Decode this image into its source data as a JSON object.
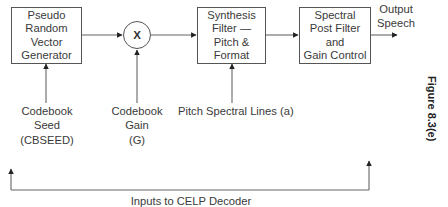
{
  "diagram": {
    "figure_label": "Figure 8.3(e)",
    "blocks": [
      {
        "id": "prvg",
        "lines": [
          "Pseudo",
          "Random",
          "Vector",
          "Generator"
        ]
      },
      {
        "id": "multiplier",
        "symbol": "X"
      },
      {
        "id": "synthesis",
        "lines": [
          "Synthesis",
          "Filter —",
          "Pitch &",
          "Format"
        ]
      },
      {
        "id": "postfilter",
        "lines": [
          "Spectral",
          "Post Filter",
          "and",
          "Gain Control"
        ]
      }
    ],
    "output": {
      "lines": [
        "Output",
        "Speech"
      ]
    },
    "inputs": [
      {
        "id": "codebook-seed",
        "lines": [
          "Codebook",
          "Seed",
          "(CBSEED)"
        ]
      },
      {
        "id": "codebook-gain",
        "lines": [
          "Codebook",
          "Gain",
          "(G)"
        ]
      },
      {
        "id": "pitch-spectral",
        "lines": [
          "Pitch Spectral Lines (a)"
        ]
      }
    ],
    "bracket_label": "Inputs to CELP Decoder",
    "colors": {
      "stroke": "#555555",
      "text": "#3a3a3a",
      "background": "#ffffff"
    }
  }
}
